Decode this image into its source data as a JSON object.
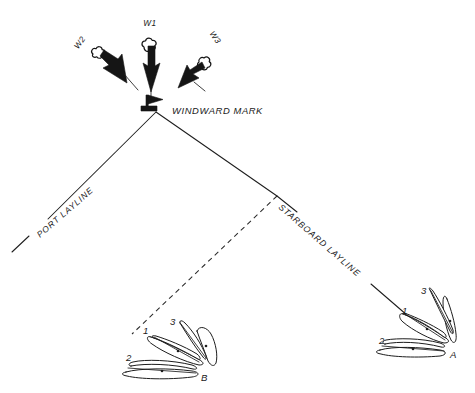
{
  "diagram": {
    "type": "sailing-tactics-diagram",
    "background_color": "#ffffff",
    "ink_color": "#1d1d1d"
  },
  "mark": {
    "label": "WINDWARD MARK",
    "icon": "flag-buoy-icon",
    "position": {
      "x": 156,
      "y": 110
    }
  },
  "wind": {
    "arrows": [
      {
        "id": "w2",
        "label": "W2",
        "label_x": 82,
        "label_y": 42,
        "label_rotation": -55,
        "tail_x": 92,
        "tail_y": 49,
        "tip_x": 128,
        "tip_y": 82,
        "direction_deg": 42
      },
      {
        "id": "w1",
        "label": "W1",
        "label_x": 150,
        "label_y": 24,
        "label_rotation": 0,
        "tail_x": 151,
        "tail_y": 42,
        "tip_x": 151,
        "tip_y": 92,
        "direction_deg": 90
      },
      {
        "id": "w3",
        "label": "W3",
        "label_x": 212,
        "label_y": 37,
        "label_rotation": 55,
        "tail_x": 208,
        "tail_y": 52,
        "tip_x": 180,
        "tip_y": 84,
        "direction_deg": 132
      }
    ]
  },
  "laylines": [
    {
      "id": "port-layline",
      "label": "PORT LAYLINE",
      "style": "solid",
      "label_rotation": 41,
      "label_x": 40,
      "label_y": 236,
      "from": {
        "x": 156,
        "y": 112
      },
      "to": {
        "x": 12,
        "y": 252
      }
    },
    {
      "id": "starboard-layline",
      "label": "STARBOARD LAYLINE",
      "style": "solid",
      "label_rotation": 41,
      "label_x": 277,
      "label_y": 206,
      "from": {
        "x": 156,
        "y": 112
      },
      "to": {
        "x": 400,
        "y": 300
      }
    },
    {
      "id": "port-tack-approach",
      "label": "",
      "style": "dashed",
      "from": {
        "x": 277,
        "y": 196
      },
      "to": {
        "x": 132,
        "y": 334
      }
    }
  ],
  "boat_groups": [
    {
      "id": "group-b",
      "group_label": "B",
      "group_label_x": 203,
      "group_label_y": 380,
      "center_x": 172,
      "center_y": 352,
      "boats": [
        {
          "number": "1",
          "label_x": 145,
          "label_y": 331
        },
        {
          "number": "2",
          "label_x": 128,
          "label_y": 358
        },
        {
          "number": "3",
          "label_x": 172,
          "label_y": 322
        }
      ]
    },
    {
      "id": "group-a",
      "group_label": "A",
      "group_label_x": 452,
      "group_label_y": 357,
      "center_x": 424,
      "center_y": 330,
      "boats": [
        {
          "number": "1",
          "label_x": 404,
          "label_y": 311
        },
        {
          "number": "2",
          "label_x": 382,
          "label_y": 341
        },
        {
          "number": "3",
          "label_x": 424,
          "label_y": 291
        }
      ]
    }
  ]
}
